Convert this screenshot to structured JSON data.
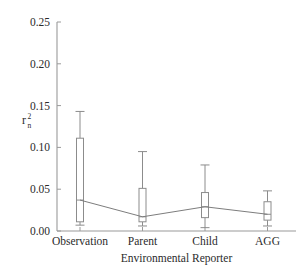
{
  "chart_data": {
    "type": "box",
    "title": "",
    "xlabel": "Environmental Reporter",
    "ylabel": "r2n",
    "ylabel_base": "r",
    "ylabel_superscript": "2",
    "ylabel_subscript": "n",
    "categories": [
      "Observation",
      "Parent",
      "Child",
      "AGG"
    ],
    "ylim": [
      0.0,
      0.25
    ],
    "ytick_labels": [
      "0.00",
      "0.05",
      "0.10",
      "0.15",
      "0.20",
      "0.25"
    ],
    "ytick_values": [
      0.0,
      0.05,
      0.1,
      0.15,
      0.2,
      0.25
    ],
    "grid": false,
    "legend": null,
    "series": [
      {
        "name": "Observation",
        "whisker_low": 0.007,
        "box_low": 0.011,
        "median": 0.037,
        "box_high": 0.111,
        "whisker_high": 0.143
      },
      {
        "name": "Parent",
        "whisker_low": 0.006,
        "box_low": 0.011,
        "median": 0.017,
        "box_high": 0.051,
        "whisker_high": 0.095
      },
      {
        "name": "Child",
        "whisker_low": 0.004,
        "box_low": 0.016,
        "median": 0.029,
        "box_high": 0.046,
        "whisker_high": 0.079
      },
      {
        "name": "AGG",
        "whisker_low": 0.006,
        "box_low": 0.013,
        "median": 0.02,
        "box_high": 0.035,
        "whisker_high": 0.048
      }
    ],
    "connector_line": {
      "visible": true,
      "values": [
        0.037,
        0.017,
        0.029,
        0.02
      ]
    },
    "colors": {
      "axis": "#9a9a9a",
      "box_stroke": "#8c8c8c",
      "box_fill": "#ffffff",
      "connector": "#7d7d7d",
      "text": "#2b2b2b",
      "background": "#ffffff"
    }
  }
}
